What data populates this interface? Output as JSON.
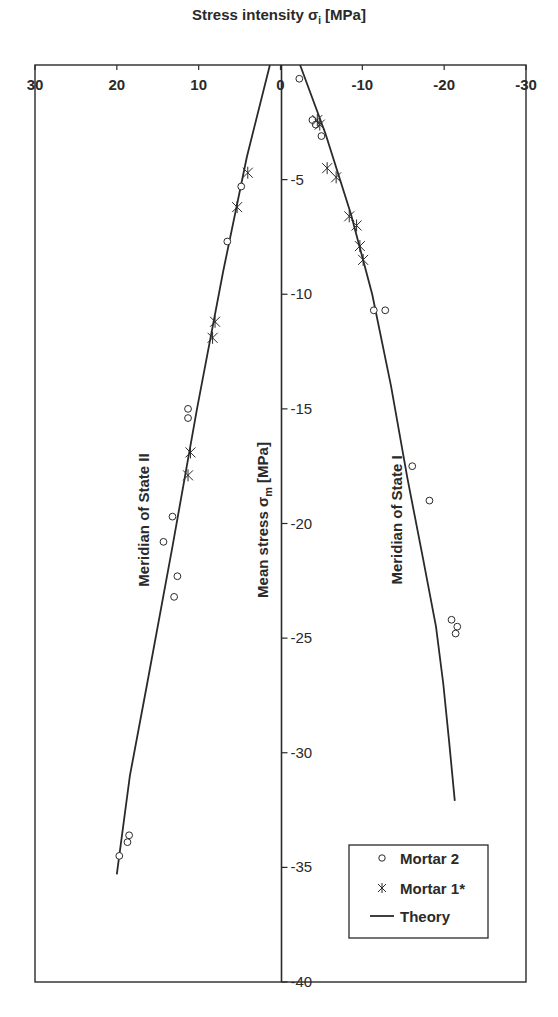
{
  "chart_data": {
    "type": "scatter",
    "title": "Stress intensity σi [MPa]",
    "xlabel": "Stress intensity σi [MPa]",
    "ylabel": "Mean stress σm [MPa]",
    "xlim": [
      30,
      -30
    ],
    "ylim": [
      0,
      -40
    ],
    "x_ticks": [
      30,
      20,
      10,
      0,
      -10,
      -20,
      -30
    ],
    "y_ticks": [
      0,
      -5,
      -10,
      -15,
      -20,
      -25,
      -30,
      -35,
      -40
    ],
    "grid": false,
    "legend_position": "lower right",
    "annotations": [
      {
        "text": "Meridian of State II",
        "orientation": "vertical",
        "x": 16.5,
        "y": -20
      },
      {
        "text": "Meridian of State I",
        "orientation": "vertical",
        "x": -14,
        "y": -20
      }
    ],
    "series": [
      {
        "name": "Mortar 2",
        "marker": "circle",
        "points": [
          [
            4.8,
            -5.3
          ],
          [
            6.5,
            -7.7
          ],
          [
            11.3,
            -15.0
          ],
          [
            11.3,
            -15.4
          ],
          [
            13.2,
            -19.7
          ],
          [
            14.3,
            -20.8
          ],
          [
            12.6,
            -22.3
          ],
          [
            13.0,
            -23.2
          ],
          [
            18.5,
            -33.6
          ],
          [
            18.7,
            -33.9
          ],
          [
            19.7,
            -34.5
          ],
          [
            -2.3,
            -0.6
          ],
          [
            -3.9,
            -2.4
          ],
          [
            -4.3,
            -2.6
          ],
          [
            -5.0,
            -3.1
          ],
          [
            -11.4,
            -10.7
          ],
          [
            -12.8,
            -10.7
          ],
          [
            -16.1,
            -17.5
          ],
          [
            -18.2,
            -19.0
          ],
          [
            -20.9,
            -24.2
          ],
          [
            -21.6,
            -24.5
          ],
          [
            -21.4,
            -24.8
          ]
        ]
      },
      {
        "name": "Mortar 1*",
        "marker": "asterisk",
        "points": [
          [
            4.0,
            -4.7
          ],
          [
            5.3,
            -6.2
          ],
          [
            8.0,
            -11.2
          ],
          [
            8.3,
            -11.9
          ],
          [
            11.0,
            -16.9
          ],
          [
            11.3,
            -17.9
          ],
          [
            -4.5,
            -2.4
          ],
          [
            -4.8,
            -2.6
          ],
          [
            -5.7,
            -4.5
          ],
          [
            -6.8,
            -4.9
          ],
          [
            -8.4,
            -6.6
          ],
          [
            -9.3,
            -7.0
          ],
          [
            -9.7,
            -7.9
          ],
          [
            -10.1,
            -8.5
          ]
        ]
      },
      {
        "name": "Theory",
        "marker": "line",
        "lines": [
          {
            "meridian": "State II",
            "points": [
              [
                1.3,
                0
              ],
              [
                4.1,
                -4.0
              ],
              [
                7.0,
                -9.0
              ],
              [
                10.2,
                -15.0
              ],
              [
                13.2,
                -21.0
              ],
              [
                16.3,
                -27.0
              ],
              [
                18.4,
                -31.0
              ],
              [
                20.0,
                -35.3
              ]
            ]
          },
          {
            "meridian": "State I",
            "points": [
              [
                -2.4,
                0
              ],
              [
                -5.5,
                -3.0
              ],
              [
                -8.6,
                -6.5
              ],
              [
                -11.2,
                -10.0
              ],
              [
                -13.5,
                -14.0
              ],
              [
                -15.5,
                -18.0
              ],
              [
                -17.4,
                -21.5
              ],
              [
                -19.0,
                -24.5
              ],
              [
                -19.9,
                -27.0
              ],
              [
                -20.6,
                -29.5
              ],
              [
                -21.3,
                -32.1
              ]
            ]
          }
        ]
      }
    ]
  },
  "title": "Stress intensity σi [MPa]",
  "axes": {
    "ylabel": "Mean stress σm [MPa]",
    "x_tick_labels": [
      "30",
      "20",
      "10",
      "0",
      "-10",
      "-20",
      "-30"
    ],
    "y_tick_labels": [
      "0",
      "-5",
      "-10",
      "-15",
      "-20",
      "-25",
      "-30",
      "-35",
      "-40"
    ]
  },
  "annotations": {
    "state2": "Meridian of State II",
    "state1": "Meridian of State I"
  },
  "legend": {
    "items": [
      {
        "label": "Mortar 2",
        "marker": "circle"
      },
      {
        "label": "Mortar 1*",
        "marker": "asterisk"
      },
      {
        "label": "Theory",
        "marker": "line"
      }
    ]
  },
  "colors": {
    "ink": "#2a2a2a",
    "background": "#ffffff"
  }
}
